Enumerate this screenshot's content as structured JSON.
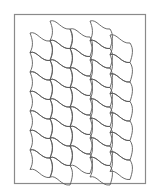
{
  "diagram": {
    "title": "",
    "frame": {
      "x": 14.5,
      "y": 14.5,
      "width": 131,
      "height": 169,
      "color": "#8a8a8a"
    },
    "line_color": "#5a5a5a",
    "lattice": {
      "cell_width": 20,
      "row_height": 19.5,
      "slope": 8,
      "bulge": 4,
      "columns": [
        {
          "x": 30,
          "top": 33,
          "rows": 7
        },
        {
          "x": 50,
          "top": 21,
          "rows": 8
        },
        {
          "x": 70,
          "top": 29,
          "rows": 7
        },
        {
          "x": 90,
          "top": 21,
          "rows": 8
        },
        {
          "x": 110,
          "top": 35,
          "rows": 7
        }
      ]
    }
  }
}
